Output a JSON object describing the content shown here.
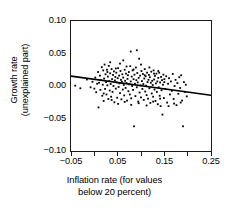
{
  "chart_data": {
    "type": "scatter",
    "title": "",
    "xlabel": "Inflation rate (for values below 20 percent)",
    "xlabel_line1": "Inflation rate (for values",
    "xlabel_line2": "below 20 percent)",
    "ylabel": "Growth rate (unexplained part)",
    "ylabel_line1": "Growth rate",
    "ylabel_line2": "(unexplained part)",
    "xlim": [
      -0.05,
      0.25
    ],
    "ylim": [
      -0.1,
      0.1
    ],
    "grid": false,
    "legend": "none",
    "marker_color": "#000000",
    "line_color": "#000000",
    "xticks": [
      -0.05,
      0.0,
      0.05,
      0.1,
      0.15,
      0.2,
      0.25
    ],
    "xtick_labels": [
      "−0.05",
      "",
      "0.05",
      "",
      "0.15",
      "",
      "0.25"
    ],
    "yticks": [
      0.1,
      0.05,
      0.0,
      -0.05,
      -0.1
    ],
    "ytick_labels": [
      "0.10",
      "0.05",
      "0.00",
      "−0.05",
      "−0.10"
    ],
    "fit_line": {
      "name": "fitted regression line",
      "x": [
        -0.05,
        0.25
      ],
      "y": [
        0.0152,
        -0.0142
      ],
      "slope": -0.098,
      "intercept": 0.0103
    },
    "series": [
      {
        "name": "countries",
        "n_points": 192,
        "points": [
          [
            -0.041,
            0.0005
          ],
          [
            -0.03,
            -0.0035
          ],
          [
            -0.016,
            0.01
          ],
          [
            -0.008,
            -0.002
          ],
          [
            -0.004,
            0.0065
          ],
          [
            0.0,
            -0.004
          ],
          [
            0.002,
            0.013
          ],
          [
            0.004,
            -0.0095
          ],
          [
            0.006,
            0.0035
          ],
          [
            0.008,
            0.0215
          ],
          [
            0.009,
            -0.033
          ],
          [
            0.01,
            0.005
          ],
          [
            0.012,
            0.016
          ],
          [
            0.013,
            -0.006
          ],
          [
            0.014,
            0.009
          ],
          [
            0.016,
            0.029
          ],
          [
            0.017,
            -0.015
          ],
          [
            0.018,
            0.002
          ],
          [
            0.019,
            0.024
          ],
          [
            0.02,
            -0.023
          ],
          [
            0.021,
            0.0115
          ],
          [
            0.022,
            0.033
          ],
          [
            0.023,
            -0.0045
          ],
          [
            0.024,
            0.018
          ],
          [
            0.025,
            0.006
          ],
          [
            0.026,
            -0.013
          ],
          [
            0.027,
            0.025
          ],
          [
            0.028,
            0.001
          ],
          [
            0.029,
            0.0145
          ],
          [
            0.03,
            -0.02
          ],
          [
            0.031,
            0.031
          ],
          [
            0.032,
            0.0075
          ],
          [
            0.033,
            -0.007
          ],
          [
            0.034,
            0.0195
          ],
          [
            0.035,
            0.003
          ],
          [
            0.036,
            -0.0165
          ],
          [
            0.037,
            0.026
          ],
          [
            0.038,
            0.0105
          ],
          [
            0.039,
            -0.009
          ],
          [
            0.04,
            0.017
          ],
          [
            0.041,
            0.0
          ],
          [
            0.042,
            0.0225
          ],
          [
            0.043,
            -0.025
          ],
          [
            0.044,
            0.0085
          ],
          [
            0.045,
            0.014
          ],
          [
            0.046,
            -0.004
          ],
          [
            0.047,
            0.0205
          ],
          [
            0.048,
            0.0055
          ],
          [
            0.049,
            -0.018
          ],
          [
            0.05,
            0.012
          ],
          [
            0.051,
            0.0275
          ],
          [
            0.052,
            -0.0015
          ],
          [
            0.053,
            0.016
          ],
          [
            0.054,
            0.004
          ],
          [
            0.055,
            -0.011
          ],
          [
            0.056,
            0.023
          ],
          [
            0.057,
            0.0095
          ],
          [
            0.058,
            -0.0205
          ],
          [
            0.059,
            0.0065
          ],
          [
            0.06,
            0.018
          ],
          [
            0.061,
            -0.0055
          ],
          [
            0.062,
            0.013
          ],
          [
            0.063,
            0.0015
          ],
          [
            0.064,
            -0.0145
          ],
          [
            0.065,
            0.025
          ],
          [
            0.066,
            0.008
          ],
          [
            0.067,
            -0.003
          ],
          [
            0.068,
            0.019
          ],
          [
            0.069,
            0.0045
          ],
          [
            0.07,
            -0.0225
          ],
          [
            0.071,
            0.011
          ],
          [
            0.072,
            0.0165
          ],
          [
            0.073,
            -0.008
          ],
          [
            0.074,
            0.0215
          ],
          [
            0.075,
            0.0025
          ],
          [
            0.076,
            -0.013
          ],
          [
            0.077,
            0.0305
          ],
          [
            0.078,
            0.007
          ],
          [
            0.079,
            -0.019
          ],
          [
            0.08,
            0.0145
          ],
          [
            0.081,
            0.0
          ],
          [
            0.082,
            0.024
          ],
          [
            0.083,
            -0.006
          ],
          [
            0.084,
            0.0105
          ],
          [
            0.085,
            -0.062
          ],
          [
            0.086,
            0.0175
          ],
          [
            0.087,
            0.0035
          ],
          [
            0.088,
            -0.0155
          ],
          [
            0.089,
            0.0285
          ],
          [
            0.09,
            0.009
          ],
          [
            0.091,
            -0.002
          ],
          [
            0.092,
            0.02
          ],
          [
            0.093,
            0.0055
          ],
          [
            0.094,
            -0.024
          ],
          [
            0.095,
            0.0125
          ],
          [
            0.096,
            0.042
          ],
          [
            0.097,
            -0.01
          ],
          [
            0.098,
            0.016
          ],
          [
            0.099,
            0.001
          ],
          [
            0.1,
            -0.0175
          ],
          [
            0.101,
            0.023
          ],
          [
            0.102,
            0.0075
          ],
          [
            0.103,
            -0.0045
          ],
          [
            0.104,
            0.0185
          ],
          [
            0.105,
            0.003
          ],
          [
            0.106,
            -0.0215
          ],
          [
            0.107,
            0.0115
          ],
          [
            0.108,
            0.026
          ],
          [
            0.109,
            -0.0085
          ],
          [
            0.11,
            0.015
          ],
          [
            0.111,
            0.0005
          ],
          [
            0.112,
            -0.014
          ],
          [
            0.113,
            0.0205
          ],
          [
            0.114,
            0.006
          ],
          [
            0.115,
            -0.0195
          ],
          [
            0.116,
            0.0095
          ],
          [
            0.117,
            0.017
          ],
          [
            0.118,
            -0.0035
          ],
          [
            0.119,
            0.0135
          ],
          [
            0.12,
            -0.026
          ],
          [
            0.121,
            0.005
          ],
          [
            0.122,
            0.022
          ],
          [
            0.123,
            -0.0115
          ],
          [
            0.124,
            0.008
          ],
          [
            0.125,
            0.0015
          ],
          [
            0.126,
            -0.0165
          ],
          [
            0.127,
            0.024
          ],
          [
            0.128,
            0.01
          ],
          [
            0.129,
            -0.0055
          ],
          [
            0.13,
            0.0155
          ],
          [
            0.131,
            -0.023
          ],
          [
            0.132,
            0.004
          ],
          [
            0.133,
            0.019
          ],
          [
            0.134,
            -0.009
          ],
          [
            0.135,
            0.007
          ],
          [
            0.136,
            -0.028
          ],
          [
            0.137,
            0.0125
          ],
          [
            0.138,
            -0.002
          ],
          [
            0.139,
            0.0205
          ],
          [
            0.14,
            -0.015
          ],
          [
            0.141,
            0.0055
          ],
          [
            0.142,
            -0.031
          ],
          [
            0.143,
            0.014
          ],
          [
            0.144,
            -0.0065
          ],
          [
            0.145,
            0.009
          ],
          [
            0.146,
            -0.044
          ],
          [
            0.147,
            0.002
          ],
          [
            0.148,
            0.0175
          ],
          [
            0.149,
            -0.0185
          ],
          [
            0.15,
            0.0105
          ],
          [
            0.152,
            -0.0045
          ],
          [
            0.154,
            0.015
          ],
          [
            0.156,
            -0.0255
          ],
          [
            0.158,
            0.0035
          ],
          [
            0.16,
            0.012
          ],
          [
            0.162,
            -0.013
          ],
          [
            0.164,
            0.007
          ],
          [
            0.166,
            -0.0075
          ],
          [
            0.168,
            0.0185
          ],
          [
            0.17,
            -0.02
          ],
          [
            0.172,
            0.0
          ],
          [
            0.174,
            0.0095
          ],
          [
            0.176,
            -0.0295
          ],
          [
            0.178,
            0.0045
          ],
          [
            0.18,
            -0.012
          ],
          [
            0.182,
            0.0135
          ],
          [
            0.184,
            -0.003
          ],
          [
            0.186,
            0.0165
          ],
          [
            0.188,
            -0.0225
          ],
          [
            0.19,
            -0.062
          ],
          [
            0.192,
            0.006
          ],
          [
            0.194,
            -0.009
          ],
          [
            0.196,
            0.002
          ],
          [
            0.198,
            -0.016
          ],
          [
            0.034,
            0.0365
          ],
          [
            0.062,
            0.0395
          ],
          [
            0.078,
            0.053
          ],
          [
            0.091,
            0.055
          ],
          [
            0.1,
            0.033
          ],
          [
            0.046,
            0.027
          ],
          [
            0.028,
            0.0215
          ],
          [
            0.118,
            0.0285
          ],
          [
            0.128,
            0.019
          ],
          [
            0.055,
            0.0345
          ],
          [
            0.069,
            0.03
          ],
          [
            0.084,
            0.0255
          ],
          [
            0.108,
            0.0165
          ],
          [
            0.137,
            0.023
          ],
          [
            0.15,
            0.006
          ],
          [
            0.02,
            -0.0115
          ],
          [
            0.037,
            -0.0215
          ],
          [
            0.051,
            -0.0275
          ],
          [
            0.065,
            -0.0245
          ],
          [
            0.079,
            -0.029
          ],
          [
            0.095,
            -0.0265
          ],
          [
            0.112,
            -0.03
          ],
          [
            0.126,
            -0.024
          ],
          [
            0.141,
            -0.0195
          ],
          [
            0.159,
            -0.031
          ],
          [
            0.171,
            -0.027
          ],
          [
            0.185,
            -0.0255
          ]
        ]
      }
    ]
  }
}
